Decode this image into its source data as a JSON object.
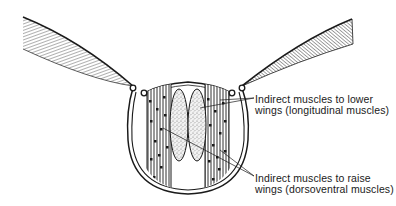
{
  "diagram": {
    "labels": {
      "lower_wings": {
        "line1": "Indirect muscles to lower",
        "line2": "wings (longitudinal muscles)"
      },
      "raise_wings": {
        "line1": "Indirect muscles to raise",
        "line2": "wings (dorsoventral muscles)"
      }
    },
    "colors": {
      "ink": "#1a1a1a",
      "background": "#ffffff",
      "stipple": "#555555"
    }
  }
}
